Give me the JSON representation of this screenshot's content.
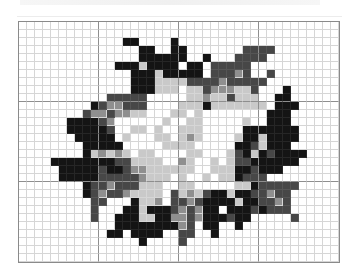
{
  "puzzle": {
    "columns": 40,
    "rows": 30,
    "cell_size_px": 8,
    "major_line_every": 10,
    "palette": {
      "0": "#ffffff",
      "1": "#c9c9c9",
      "2": "#8f8f8f",
      "3": "#474747",
      "4": "#141414"
    },
    "grid": [
      "0000000000000000000000000000000000000000",
      "0000000000000000000000000000000000000000",
      "0000000000000440000400000000000000000000",
      "0000000000000004400440000000333300000000",
      "0000000000000004444440040003333000000000",
      "0000000000004441444404403333300000000000",
      "0000000000000044414444403332300300000000",
      "0000000000000044411113333233333000000000",
      "0000000000000044411101132221130004000000",
      "0000000000033333000001121131110044000000",
      "0000000004322333000011141111111044400000",
      "0000000032232211000110100000000444000000",
      "0000004444320000001001100000100444000000",
      "0000004444430011010011100000444444400000",
      "0000000444440100011012100001441444400000",
      "0000000044444000001111000004431444000000",
      "0000000041212101100001100013414344440000",
      "0000444444443311110021001013344444400000",
      "0000044444344322111111001114434440000000",
      "0000044444333332111010010114333000000000",
      "0000000043323331110011000001143333300000",
      "0000000043233211110312134414433233000000",
      "0000000003300041120332344441443323000000",
      "0000000003000441444323244044434333000000",
      "0000000003004441144223244434400000300000",
      "0000000000004444444423044004000000000000",
      "0000000000044044440033004000000000000000",
      "0000000000000004000030000000000000000000",
      "0000000000000000000000000000000000000000",
      "0000000000000000000000000000000000000000"
    ]
  }
}
